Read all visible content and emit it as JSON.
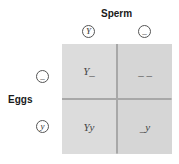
{
  "diagram": {
    "type": "punnett-square",
    "column_header": "Sperm",
    "row_header": "Eggs",
    "columns": [
      {
        "allele": "Y"
      },
      {
        "allele": "_"
      }
    ],
    "rows": [
      {
        "allele": "_"
      },
      {
        "allele": "y"
      }
    ],
    "cells": [
      [
        "Y_",
        "_ _"
      ],
      [
        "Yy",
        "_y"
      ]
    ],
    "colors": {
      "cell_fill": "#dcdcdc",
      "divider": "#a8a8a8",
      "circle_stroke": "#555555"
    }
  }
}
